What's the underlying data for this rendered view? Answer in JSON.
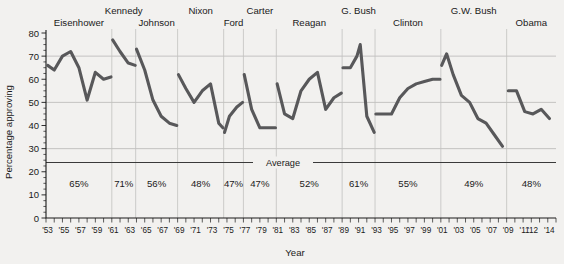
{
  "chart_data": {
    "type": "line",
    "title": "",
    "xlabel": "Year",
    "ylabel": "Percentage approving",
    "ylim": [
      0,
      80
    ],
    "ytick_step": 10,
    "yticks": [
      "0",
      "10",
      "20",
      "30",
      "40",
      "50",
      "60",
      "70",
      "80"
    ],
    "xlim": [
      1953,
      2015
    ],
    "xticks": [
      "'53",
      "'55",
      "'57",
      "'59",
      "'61",
      "'63",
      "'65",
      "'67",
      "'69",
      "'71",
      "'73",
      "'75",
      "'77",
      "'79",
      "'81",
      "'83",
      "'85",
      "'87",
      "'89",
      "'91",
      "'93",
      "'95",
      "'97",
      "'99",
      "'01",
      "'03",
      "'05",
      "'07",
      "'09",
      "'11",
      "'12",
      "'14"
    ],
    "xtick_years": [
      1953,
      1955,
      1957,
      1959,
      1961,
      1963,
      1965,
      1967,
      1969,
      1971,
      1973,
      1975,
      1977,
      1979,
      1981,
      1983,
      1985,
      1987,
      1989,
      1991,
      1993,
      1995,
      1997,
      1999,
      2001,
      2003,
      2005,
      2007,
      2009,
      2011,
      2012,
      2014
    ],
    "grid": "both",
    "legend": "none",
    "line_color": "#58585a",
    "average_label": "Average",
    "average_value": 24,
    "series": [
      {
        "name": "Eisenhower",
        "percent_label": "65%",
        "term_start": 1953,
        "term_end": 1961,
        "x": [
          1953.2,
          1954.0,
          1955.0,
          1956.0,
          1957.0,
          1958.0,
          1959.0,
          1960.0,
          1960.9
        ],
        "values": [
          66,
          64,
          70,
          72,
          65,
          51,
          63,
          60,
          61
        ]
      },
      {
        "name": "Kennedy",
        "percent_label": "71%",
        "term_start": 1961,
        "term_end": 1963.9,
        "x": [
          1961.1,
          1962.0,
          1963.0,
          1963.85
        ],
        "values": [
          77,
          72,
          67,
          66
        ]
      },
      {
        "name": "Johnson",
        "percent_label": "56%",
        "term_start": 1963.9,
        "term_end": 1969,
        "x": [
          1964.0,
          1965.0,
          1966.0,
          1967.0,
          1968.0,
          1968.9
        ],
        "values": [
          73,
          64,
          51,
          44,
          41,
          40
        ]
      },
      {
        "name": "Nixon",
        "percent_label": "48%",
        "term_start": 1969,
        "term_end": 1974.6,
        "x": [
          1969.1,
          1970.0,
          1971.0,
          1972.0,
          1973.0,
          1974.0,
          1974.5
        ],
        "values": [
          62,
          56,
          50,
          55,
          58,
          41,
          39
        ]
      },
      {
        "name": "Ford",
        "percent_label": "47%",
        "term_start": 1974.6,
        "term_end": 1977,
        "x": [
          1974.7,
          1975.3,
          1976.2,
          1976.9
        ],
        "values": [
          37,
          44,
          48,
          50
        ]
      },
      {
        "name": "Carter",
        "percent_label": "47%",
        "term_start": 1977,
        "term_end": 1981,
        "x": [
          1977.1,
          1978.0,
          1979.0,
          1980.0,
          1980.9
        ],
        "values": [
          62,
          47,
          39,
          39,
          39
        ]
      },
      {
        "name": "Reagan",
        "percent_label": "52%",
        "term_start": 1981,
        "term_end": 1989,
        "x": [
          1981.1,
          1982.0,
          1983.0,
          1984.0,
          1985.0,
          1986.0,
          1987.0,
          1988.0,
          1988.9
        ],
        "values": [
          58,
          45,
          43,
          55,
          60,
          63,
          47,
          52,
          54
        ]
      },
      {
        "name": "G. Bush",
        "percent_label": "61%",
        "term_start": 1989,
        "term_end": 1993,
        "x": [
          1989.1,
          1990.0,
          1990.8,
          1991.2,
          1992.0,
          1992.9
        ],
        "values": [
          65,
          65,
          70,
          75,
          44,
          37
        ]
      },
      {
        "name": "Clinton",
        "percent_label": "55%",
        "term_start": 1993,
        "term_end": 2001,
        "x": [
          1993.1,
          1994.0,
          1995.0,
          1996.0,
          1997.0,
          1998.0,
          1999.0,
          2000.0,
          2000.9
        ],
        "values": [
          45,
          45,
          45,
          52,
          56,
          58,
          59,
          60,
          60
        ]
      },
      {
        "name": "G.W. Bush",
        "percent_label": "49%",
        "term_start": 2001,
        "term_end": 2009,
        "x": [
          2001.1,
          2001.7,
          2002.5,
          2003.5,
          2004.5,
          2005.5,
          2006.5,
          2007.5,
          2008.5
        ],
        "values": [
          66,
          71,
          62,
          53,
          50,
          43,
          41,
          36,
          31
        ]
      },
      {
        "name": "Obama",
        "percent_label": "48%",
        "term_start": 2009,
        "term_end": 2015,
        "x": [
          2009.2,
          2010.2,
          2011.2,
          2012.2,
          2013.2,
          2014.2
        ],
        "values": [
          55,
          55,
          46,
          45,
          47,
          43
        ]
      }
    ]
  }
}
